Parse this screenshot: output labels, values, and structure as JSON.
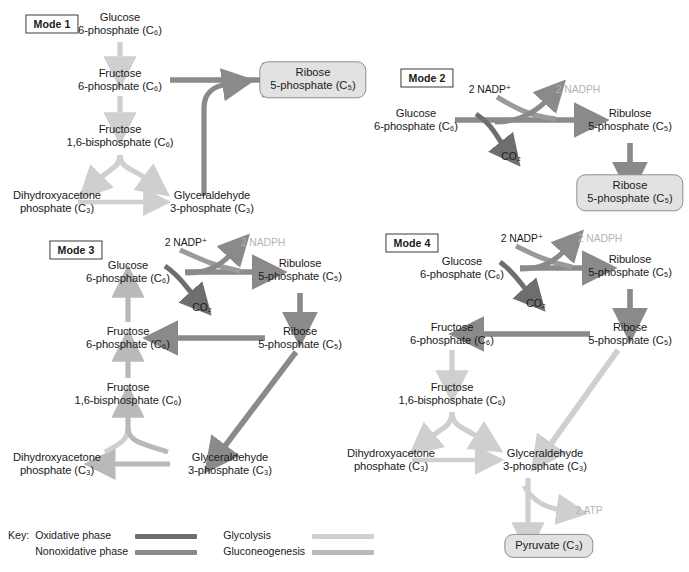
{
  "colors": {
    "oxidative": "#6e6e6e",
    "nonoxidative": "#8a8a8a",
    "glycolysis": "#cfcfcf",
    "gluconeogenesis": "#b9b9b9",
    "faded_text": "#b4b4b4",
    "pill_fill": "#e2e2e2",
    "pill_border": "#8e8e8e"
  },
  "key": {
    "label": "Key:",
    "items": [
      {
        "name": "oxidative-phase",
        "label": "Oxidative phase",
        "color": "#6e6e6e"
      },
      {
        "name": "nonoxidative-phase",
        "label": "Nonoxidative phase",
        "color": "#8a8a8a"
      },
      {
        "name": "glycolysis",
        "label": "Glycolysis",
        "color": "#cfcfcf"
      },
      {
        "name": "gluconeogenesis",
        "label": "Gluconeogenesis",
        "color": "#b9b9b9"
      }
    ]
  },
  "modes": {
    "mode1": {
      "label": "Mode 1"
    },
    "mode2": {
      "label": "Mode 2"
    },
    "mode3": {
      "label": "Mode 3"
    },
    "mode4": {
      "label": "Mode 4"
    }
  },
  "metabolites": {
    "glucose6p_l1": "Glucose",
    "glucose6p_l2": "6-phosphate (C₆)",
    "fructose6p_l1": "Fructose",
    "fructose6p_l2": "6-phosphate (C₆)",
    "fbp_l1": "Fructose",
    "fbp_l2": "1,6-bisphosphate (C₆)",
    "dhap_l1": "Dihydroxyacetone",
    "dhap_l2": "phosphate (C₃)",
    "gap_l1": "Glyceraldehyde",
    "gap_l2": "3-phosphate (C₃)",
    "ribose5p_l1": "Ribose",
    "ribose5p_l2": "5-phosphate (C₅)",
    "ribulose5p_l1": "Ribulose",
    "ribulose5p_l2": "5-phosphate (C₅)",
    "pyruvate": "Pyruvate (C₃)",
    "co2": "CO₂",
    "nadp": "2 NADP⁺",
    "nadph": "2 NADPH",
    "atp": "2 ATP"
  },
  "mode1": {
    "nodes": [
      {
        "name": "glucose-6-phosphate",
        "line1": "Glucose",
        "line2": "6-phosphate (C₆)"
      },
      {
        "name": "fructose-6-phosphate",
        "line1": "Fructose",
        "line2": "6-phosphate (C₆)"
      },
      {
        "name": "fructose-1-6-bisphosphate",
        "line1": "Fructose",
        "line2": "1,6-bisphosphate (C₆)"
      },
      {
        "name": "dihydroxyacetone-phosphate",
        "line1": "Dihydroxyacetone",
        "line2": "phosphate (C₃)"
      },
      {
        "name": "glyceraldehyde-3-phosphate",
        "line1": "Glyceraldehyde",
        "line2": "3-phosphate (C₃)"
      },
      {
        "name": "ribose-5-phosphate",
        "line1": "Ribose",
        "line2": "5-phosphate (C₅)"
      }
    ],
    "product": "Ribose 5-phosphate (C5)"
  },
  "mode2": {
    "nodes": [
      {
        "name": "glucose-6-phosphate",
        "line1": "Glucose",
        "line2": "6-phosphate (C₆)"
      },
      {
        "name": "ribulose-5-phosphate",
        "line1": "Ribulose",
        "line2": "5-phosphate (C₅)"
      },
      {
        "name": "ribose-5-phosphate",
        "line1": "Ribose",
        "line2": "5-phosphate (C₅)"
      }
    ],
    "cofactor_in": "2 NADP⁺",
    "cofactor_out": "2 NADPH",
    "byproduct": "CO₂"
  },
  "mode3": {
    "nodes": [
      {
        "name": "glucose-6-phosphate",
        "line1": "Glucose",
        "line2": "6-phosphate (C₆)"
      },
      {
        "name": "ribulose-5-phosphate",
        "line1": "Ribulose",
        "line2": "5-phosphate (C₅)"
      },
      {
        "name": "ribose-5-phosphate",
        "line1": "Ribose",
        "line2": "5-phosphate (C₅)"
      },
      {
        "name": "fructose-6-phosphate",
        "line1": "Fructose",
        "line2": "6-phosphate (C₆)"
      },
      {
        "name": "fructose-1-6-bisphosphate",
        "line1": "Fructose",
        "line2": "1,6-bisphosphate (C₆)"
      },
      {
        "name": "dihydroxyacetone-phosphate",
        "line1": "Dihydroxyacetone",
        "line2": "phosphate (C₃)"
      },
      {
        "name": "glyceraldehyde-3-phosphate",
        "line1": "Glyceraldehyde",
        "line2": "3-phosphate (C₃)"
      }
    ],
    "cofactor_in": "2 NADP⁺",
    "cofactor_out": "2 NADPH",
    "byproduct": "CO₂"
  },
  "mode4": {
    "nodes": [
      {
        "name": "glucose-6-phosphate",
        "line1": "Glucose",
        "line2": "6-phosphate (C₆)"
      },
      {
        "name": "ribulose-5-phosphate",
        "line1": "Ribulose",
        "line2": "5-phosphate (C₅)"
      },
      {
        "name": "ribose-5-phosphate",
        "line1": "Ribose",
        "line2": "5-phosphate (C₅)"
      },
      {
        "name": "fructose-6-phosphate",
        "line1": "Fructose",
        "line2": "6-phosphate (C₆)"
      },
      {
        "name": "fructose-1-6-bisphosphate",
        "line1": "Fructose",
        "line2": "1,6-bisphosphate (C₆)"
      },
      {
        "name": "dihydroxyacetone-phosphate",
        "line1": "Dihydroxyacetone",
        "line2": "phosphate (C₃)"
      },
      {
        "name": "glyceraldehyde-3-phosphate",
        "line1": "Glyceraldehyde",
        "line2": "3-phosphate (C₃)"
      }
    ],
    "cofactor_in": "2 NADP⁺",
    "cofactor_out": "2 NADPH",
    "byproduct": "CO₂",
    "energy": "2 ATP",
    "product": "Pyruvate (C₃)"
  }
}
